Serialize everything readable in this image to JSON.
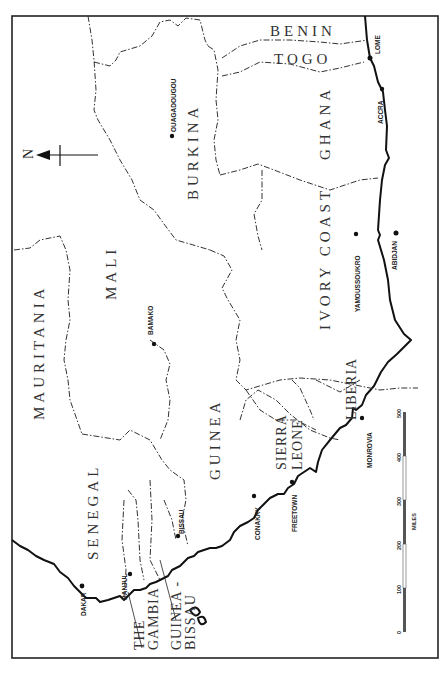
{
  "map": {
    "title": "West Africa",
    "orientation": "rotated 90° (north points left)",
    "north_arrow": {
      "label": "N"
    },
    "countries": [
      {
        "name": "MAURITANIA"
      },
      {
        "name": "MALI"
      },
      {
        "name": "BURKINA"
      },
      {
        "name": "BENIN"
      },
      {
        "name": "TOGO"
      },
      {
        "name": "GHANA"
      },
      {
        "name": "IVORY COAST"
      },
      {
        "name": "LIBERIA"
      },
      {
        "name": "SIERRA"
      },
      {
        "name": "LEONE"
      },
      {
        "name": "GUINEA"
      },
      {
        "name": "SENEGAL"
      },
      {
        "name": "THE"
      },
      {
        "name": "GAMBIA"
      },
      {
        "name": "GUINEA -"
      },
      {
        "name": "BISSAU"
      }
    ],
    "cities": [
      {
        "name": "OUAGADOUGOU"
      },
      {
        "name": "BAMAKO"
      },
      {
        "name": "LOME"
      },
      {
        "name": "ACCRA"
      },
      {
        "name": "ABIDJAN"
      },
      {
        "name": "YAMOUSSOUKRO"
      },
      {
        "name": "MONROVIA"
      },
      {
        "name": "FREETOWN"
      },
      {
        "name": "CONAKRY"
      },
      {
        "name": "BISSAU"
      },
      {
        "name": "BANJUL"
      },
      {
        "name": "DAKAR"
      }
    ],
    "scale": {
      "unit": "MILES",
      "ticks": [
        "0",
        "100",
        "200",
        "300",
        "400",
        "500"
      ]
    }
  }
}
